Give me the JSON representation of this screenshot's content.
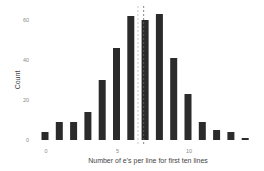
{
  "chart_data": {
    "type": "bar",
    "title": "",
    "xlabel": "Number of e's per line for first ten lines",
    "ylabel": "Count",
    "categories": [
      0,
      1,
      2,
      3,
      4,
      5,
      6,
      7,
      8,
      9,
      10,
      11,
      12,
      13,
      14
    ],
    "values": [
      4,
      9,
      9,
      14,
      30,
      46,
      62,
      60,
      63,
      41,
      23,
      9,
      5,
      4,
      1
    ],
    "x_ticks": [
      "0",
      "5",
      "10"
    ],
    "x_tick_values": [
      0,
      5,
      10
    ],
    "y_ticks": [
      "0",
      "20",
      "40",
      "60"
    ],
    "y_tick_values": [
      0,
      20,
      40,
      60
    ],
    "xlim": [
      -0.5,
      14.5
    ],
    "ylim": [
      0,
      65
    ],
    "grid": false,
    "legend": null,
    "reference_lines": [
      {
        "type": "vline",
        "x": 6.5,
        "style": "dashed",
        "color": "#bbbbbb"
      },
      {
        "type": "vline",
        "x": 6.9,
        "style": "dashed",
        "color": "#666666"
      }
    ],
    "bar_color": "#2b2b2b"
  }
}
